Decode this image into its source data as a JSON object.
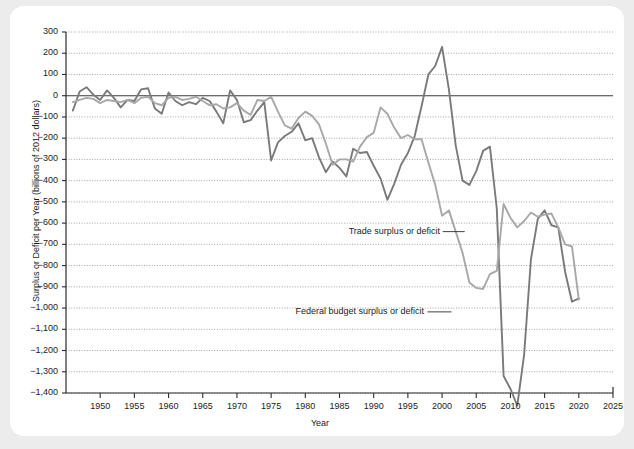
{
  "chart_data": {
    "type": "line",
    "title": "",
    "xlabel": "Year",
    "ylabel": "Surplus or Deficit per Year (billions of 2012 dollars)",
    "xlim": [
      1945,
      2025
    ],
    "ylim": [
      -1400,
      300
    ],
    "grid": true,
    "legend_position": "inline-annotations",
    "yticks": [
      300,
      200,
      100,
      0,
      -100,
      -200,
      -300,
      -400,
      -500,
      -600,
      -700,
      -800,
      -900,
      -1000,
      -1100,
      -1200,
      -1300,
      -1400
    ],
    "ytick_labels": [
      "300",
      "200",
      "100",
      "0",
      "−100",
      "−200",
      "−300",
      "−400",
      "−500",
      "−600",
      "−700",
      "−800",
      "−900",
      "−1,000",
      "−1,100",
      "−1,200",
      "−1,300",
      "−1,400"
    ],
    "xticks": [
      1950,
      1955,
      1960,
      1965,
      1970,
      1975,
      1980,
      1985,
      1990,
      1995,
      2000,
      2005,
      2010,
      2015,
      2020,
      2025
    ],
    "xtick_labels": [
      "1950",
      "1955",
      "1960",
      "1965",
      "1970",
      "1975",
      "1980",
      "1985",
      "1990",
      "1995",
      "2000",
      "2005",
      "2010",
      "2015",
      "2020",
      "2025"
    ],
    "annotations": [
      {
        "text": "Trade surplus or deficit",
        "x": 1993,
        "y": -640
      },
      {
        "text": "Federal budget surplus or deficit",
        "x": 1988,
        "y": -1018
      }
    ],
    "series": [
      {
        "name": "Federal budget surplus or deficit",
        "color": "#7a7a7a",
        "x": [
          1946,
          1947,
          1948,
          1949,
          1950,
          1951,
          1952,
          1953,
          1954,
          1955,
          1956,
          1957,
          1958,
          1959,
          1960,
          1961,
          1962,
          1963,
          1964,
          1965,
          1966,
          1967,
          1968,
          1969,
          1970,
          1971,
          1972,
          1973,
          1974,
          1975,
          1976,
          1977,
          1978,
          1979,
          1980,
          1981,
          1982,
          1983,
          1984,
          1985,
          1986,
          1987,
          1988,
          1989,
          1990,
          1991,
          1992,
          1993,
          1994,
          1995,
          1996,
          1997,
          1998,
          1999,
          2000,
          2001,
          2002,
          2003,
          2004,
          2005,
          2006,
          2007,
          2008,
          2009,
          2010,
          2011,
          2012,
          2013,
          2014,
          2015,
          2016,
          2017,
          2018,
          2019,
          2020
        ],
        "y": [
          -70,
          20,
          40,
          5,
          -20,
          25,
          -10,
          -55,
          -20,
          -25,
          30,
          35,
          -60,
          -85,
          15,
          -25,
          -45,
          -30,
          -40,
          -10,
          -25,
          -75,
          -130,
          25,
          -20,
          -125,
          -115,
          -70,
          -30,
          -305,
          -220,
          -190,
          -170,
          -130,
          -210,
          -200,
          -290,
          -360,
          -310,
          -340,
          -380,
          -250,
          -270,
          -265,
          -330,
          -390,
          -490,
          -415,
          -325,
          -270,
          -190,
          -50,
          100,
          140,
          230,
          30,
          -235,
          -400,
          -420,
          -355,
          -260,
          -240,
          -530,
          -1320,
          -1380,
          -1460,
          -1220,
          -770,
          -580,
          -540,
          -610,
          -620,
          -830,
          -970,
          -955
        ]
      },
      {
        "name": "Trade surplus or deficit",
        "color": "#a8a8a8",
        "x": [
          1946,
          1947,
          1948,
          1949,
          1950,
          1951,
          1952,
          1953,
          1954,
          1955,
          1956,
          1957,
          1958,
          1959,
          1960,
          1961,
          1962,
          1963,
          1964,
          1965,
          1966,
          1967,
          1968,
          1969,
          1970,
          1971,
          1972,
          1973,
          1974,
          1975,
          1976,
          1977,
          1978,
          1979,
          1980,
          1981,
          1982,
          1983,
          1984,
          1985,
          1986,
          1987,
          1988,
          1989,
          1990,
          1991,
          1992,
          1993,
          1994,
          1995,
          1996,
          1997,
          1998,
          1999,
          2000,
          2001,
          2002,
          2003,
          2004,
          2005,
          2006,
          2007,
          2008,
          2009,
          2010,
          2011,
          2012,
          2013,
          2014,
          2015,
          2016,
          2017,
          2018,
          2019,
          2020
        ],
        "y": [
          -30,
          -20,
          -10,
          -15,
          -35,
          -20,
          -25,
          -30,
          -20,
          -35,
          -10,
          -5,
          -35,
          -45,
          -10,
          -5,
          -20,
          -15,
          -5,
          -25,
          -45,
          -40,
          -60,
          -55,
          -35,
          -70,
          -90,
          -20,
          -25,
          -5,
          -75,
          -140,
          -155,
          -105,
          -75,
          -95,
          -135,
          -225,
          -325,
          -300,
          -300,
          -310,
          -240,
          -195,
          -175,
          -55,
          -85,
          -150,
          -200,
          -185,
          -205,
          -205,
          -315,
          -420,
          -565,
          -540,
          -640,
          -740,
          -880,
          -905,
          -910,
          -840,
          -825,
          -510,
          -575,
          -620,
          -590,
          -550,
          -570,
          -560,
          -555,
          -620,
          -700,
          -710,
          -960
        ]
      }
    ]
  }
}
